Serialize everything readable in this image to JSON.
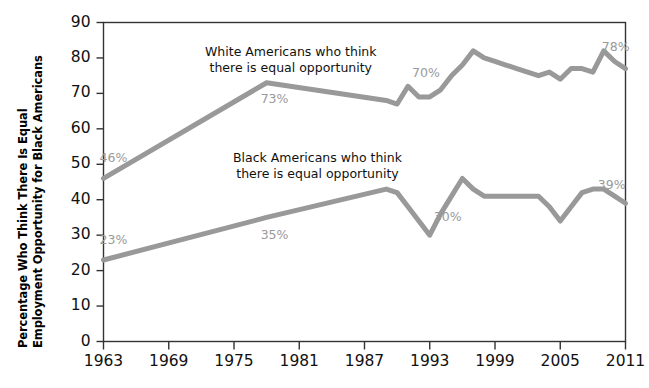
{
  "chart_data": {
    "type": "line",
    "title": "",
    "xlabel": "",
    "ylabel": "Percentage Who Think There Is Equal Employment Opportunity for Black Americans",
    "ylabel_lines": [
      "Percentage Who Think There Is Equal",
      "Employment Opportunity for Black Americans"
    ],
    "xlim": [
      1963,
      2011
    ],
    "ylim": [
      0,
      90
    ],
    "ytick_values": [
      0,
      10,
      20,
      30,
      40,
      50,
      60,
      70,
      80,
      90
    ],
    "ytick_labels": [
      "0",
      "10",
      "20",
      "30",
      "40",
      "50",
      "60",
      "70",
      "80",
      "90"
    ],
    "xtick_values": [
      1963,
      1969,
      1975,
      1981,
      1987,
      1993,
      1999,
      2005,
      2011
    ],
    "xtick_labels": [
      "1963",
      "1969",
      "1975",
      "1981",
      "1987",
      "1993",
      "1999",
      "2005",
      "2011"
    ],
    "grid": false,
    "legend_position": "inline-annotation",
    "line_color": "#999999",
    "axis_color": "#333333",
    "label_color": "#9a9a9a",
    "series": [
      {
        "name": "White Americans who think there is equal opportunity",
        "annotation": {
          "line1": "White Americans who think",
          "line2": "there is equal opportunity"
        },
        "x": [
          1963,
          1978,
          1989,
          1990,
          1991,
          1992,
          1993,
          1994,
          1995,
          1996,
          1997,
          1998,
          1999,
          2000,
          2001,
          2002,
          2003,
          2004,
          2005,
          2006,
          2007,
          2008,
          2009,
          2010,
          2011
        ],
        "values": [
          46,
          73,
          68,
          67,
          72,
          69,
          69,
          71,
          75,
          78,
          82,
          80,
          79,
          78,
          77,
          76,
          75,
          76,
          74,
          77,
          77,
          76,
          82,
          79,
          77
        ],
        "point_labels": [
          {
            "x": 1963,
            "value": 46,
            "text": "46%"
          },
          {
            "x": 1978,
            "value": 73,
            "text": "73%"
          },
          {
            "x": 1991,
            "value": 70,
            "text": "70%"
          },
          {
            "x": 2009,
            "value": 78,
            "text": "78%"
          }
        ]
      },
      {
        "name": "Black Americans who think there is equal opportunity",
        "annotation": {
          "line1": "Black Americans who think",
          "line2": "there is equal opportunity"
        },
        "x": [
          1963,
          1978,
          1989,
          1990,
          1991,
          1992,
          1993,
          1994,
          1995,
          1996,
          1997,
          1998,
          1999,
          2000,
          2001,
          2002,
          2003,
          2004,
          2005,
          2006,
          2007,
          2008,
          2009,
          2010,
          2011
        ],
        "values": [
          23,
          35,
          43,
          42,
          38,
          34,
          30,
          36,
          41,
          46,
          43,
          41,
          41,
          41,
          41,
          41,
          41,
          38,
          34,
          38,
          42,
          43,
          43,
          41,
          39
        ],
        "point_labels": [
          {
            "x": 1963,
            "value": 23,
            "text": "23%"
          },
          {
            "x": 1978,
            "value": 35,
            "text": "35%"
          },
          {
            "x": 1993,
            "value": 30,
            "text": "30%"
          },
          {
            "x": 2009,
            "value": 39,
            "text": "39%"
          }
        ]
      }
    ]
  }
}
